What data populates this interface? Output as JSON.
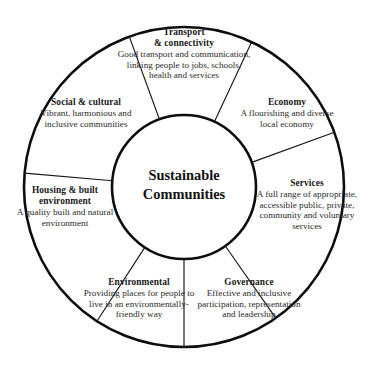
{
  "diagram": {
    "title": "Sustainable Communities",
    "type": "radial-wheel",
    "hub": {
      "line1": "Sustainable",
      "line2": "Communities"
    },
    "colors": {
      "background": "#ffffff",
      "outline": "#0d0d0d",
      "divider": "#171717",
      "title_text": "#1a1a1a",
      "body_text": "#2a2a2a"
    },
    "geometry": {
      "center_x": 184,
      "center_y": 187,
      "outer_radius": 161,
      "inner_radius": 72,
      "segment_count": 7
    },
    "segments": [
      {
        "id": "transport",
        "title": "Transport\n& connectivity",
        "title_line1": "Transport",
        "title_line2": "& connectivity",
        "description": "Good transport and communication, linking people to jobs, schools, health and services"
      },
      {
        "id": "social",
        "title": "Social & cultural",
        "description": "Vibrant, harmonious and inclusive communities"
      },
      {
        "id": "economy",
        "title": "Economy",
        "description": "A flourishing and diverse local economy"
      },
      {
        "id": "services",
        "title": "Services",
        "description": "A full range of appropriate, accessible public, private, community and voluntary services"
      },
      {
        "id": "housing",
        "title": "Housing & built\nenvironment",
        "title_line1": "Housing & built",
        "title_line2": "environment",
        "description": "A quality built and natural environment"
      },
      {
        "id": "environmental",
        "title": "Environmental",
        "description": "Providing places for people to live in an environmentally-friendly way"
      },
      {
        "id": "governance",
        "title": "Governance",
        "description": "Effective and inclusive participation, representation and leadership"
      }
    ]
  }
}
